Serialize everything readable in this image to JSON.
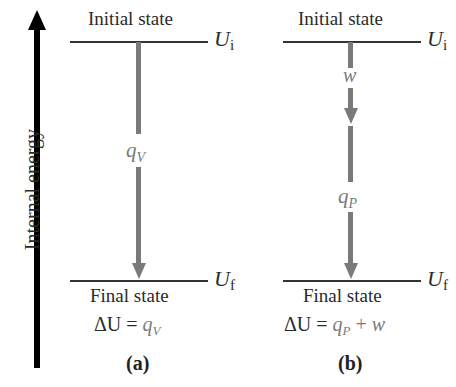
{
  "axis": {
    "label": "Internal energy",
    "direction": "up"
  },
  "panels": [
    {
      "caption": "(a)",
      "top_state": "Initial state",
      "bottom_state": "Final state",
      "top_energy": {
        "symbol": "U",
        "sub": "i"
      },
      "bottom_energy": {
        "symbol": "U",
        "sub": "f"
      },
      "arrows": [
        {
          "symbol": "q",
          "sub": "V"
        }
      ],
      "equation": {
        "lhs": "ΔU =",
        "terms": [
          {
            "symbol": "q",
            "sub": "V"
          }
        ]
      }
    },
    {
      "caption": "(b)",
      "top_state": "Initial state",
      "bottom_state": "Final state",
      "top_energy": {
        "symbol": "U",
        "sub": "i"
      },
      "bottom_energy": {
        "symbol": "U",
        "sub": "f"
      },
      "arrows": [
        {
          "symbol": "w",
          "sub": ""
        },
        {
          "symbol": "q",
          "sub": "P"
        }
      ],
      "equation": {
        "lhs": "ΔU =",
        "terms": [
          {
            "symbol": "q",
            "sub": "P"
          },
          {
            "op": "+"
          },
          {
            "symbol": "w",
            "sub": ""
          }
        ]
      }
    }
  ],
  "colors": {
    "arrow": "#7a7a7a",
    "axis": "#000000",
    "line": "#333333"
  }
}
